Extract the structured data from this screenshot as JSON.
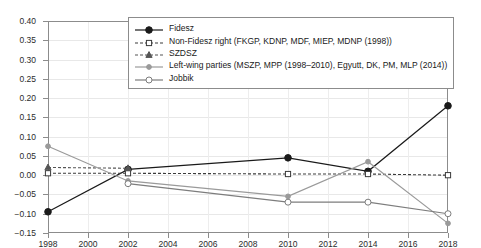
{
  "chart_data": {
    "type": "line",
    "title": "",
    "xlabel": "",
    "ylabel": "",
    "x": [
      1998,
      2002,
      2006,
      2010,
      2014,
      2018
    ],
    "xlim": [
      1998,
      2018
    ],
    "ylim": [
      -0.15,
      0.4
    ],
    "ytick_labels": [
      "0.40",
      "0.35",
      "0.30",
      "0.25",
      "0.20",
      "0.15",
      "0.10",
      "0.05",
      "0.00",
      "-0.05",
      "-0.10",
      "-0.15"
    ],
    "ytick_values": [
      0.4,
      0.35,
      0.3,
      0.25,
      0.2,
      0.15,
      0.1,
      0.05,
      0.0,
      -0.05,
      -0.1,
      -0.15
    ],
    "xtick_labels": [
      "1998",
      "2000",
      "2002",
      "2004",
      "2006",
      "2008",
      "2010",
      "2012",
      "2014",
      "2016",
      "2018"
    ],
    "xtick_values": [
      1998,
      2000,
      2002,
      2004,
      2006,
      2008,
      2010,
      2012,
      2014,
      2016,
      2018
    ],
    "grid": true,
    "legend_position": "top-center",
    "series": [
      {
        "name": "Fidesz",
        "x": [
          1998,
          2002,
          2010,
          2014,
          2018
        ],
        "values": [
          -0.095,
          0.015,
          0.045,
          0.01,
          0.18
        ],
        "color": "#1a1a1a",
        "linestyle": "solid",
        "marker": "filled-circle"
      },
      {
        "name": "Non-Fidesz right (FKGP, KDNP, MDF, MIEP, MDNP (1998))",
        "x": [
          1998,
          2002,
          2010,
          2014,
          2018
        ],
        "values": [
          0.005,
          0.005,
          0.003,
          0.003,
          0.0
        ],
        "color": "#3a3a3a",
        "linestyle": "dashed",
        "marker": "open-square"
      },
      {
        "name": "SZDSZ",
        "x": [
          1998,
          2002
        ],
        "values": [
          0.02,
          0.018
        ],
        "color": "#555555",
        "linestyle": "dashed",
        "marker": "filled-triangle"
      },
      {
        "name": "Left-wing parties (MSZP, MPP (1998–2010), Egyutt, DK, PM, MLP (2014))",
        "x": [
          1998,
          2002,
          2010,
          2014,
          2018
        ],
        "values": [
          0.075,
          -0.015,
          -0.055,
          0.035,
          -0.125
        ],
        "color": "#9a9a9a",
        "linestyle": "solid",
        "marker": "filled-circle-small"
      },
      {
        "name": "Jobbik",
        "x": [
          2002,
          2010,
          2014,
          2018
        ],
        "values": [
          -0.022,
          -0.07,
          -0.07,
          -0.1
        ],
        "color": "#7d7d7d",
        "linestyle": "solid",
        "marker": "open-circle"
      }
    ]
  }
}
